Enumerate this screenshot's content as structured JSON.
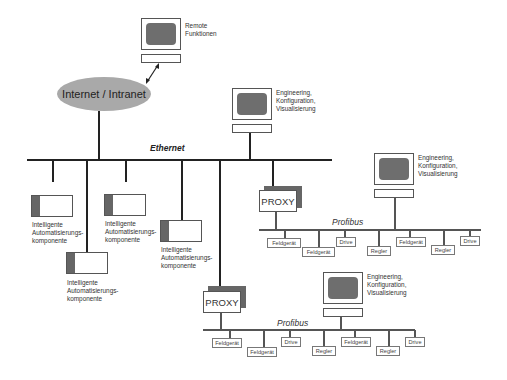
{
  "diagram": {
    "cloud": {
      "label": "Internet / Intranet"
    },
    "remote": {
      "label": "Remote\nFunktionen"
    },
    "engineering_top": {
      "label": "Engineering,\nKonfiguration,\nVisualisierung"
    },
    "ethernet": {
      "label": "Ethernet"
    },
    "components": [
      {
        "label": "Intelligente\nAutomatisierungs-\nkomponente"
      },
      {
        "label": "Intelligente\nAutomatisierungs-\nkomponente"
      },
      {
        "label": "Intelligente\nAutomatisierungs-\nkomponente"
      },
      {
        "label": "Intelligente\nAutomatisierungs-\nkomponente"
      }
    ],
    "profibus_1": {
      "proxy_label": "PROXY",
      "bus_label": "Profibus",
      "engineering_label": "Engineering,\nKonfiguration,\nVisualisierung",
      "devices": [
        "Feldgerät",
        "Feldgerät",
        "Drive",
        "Regler",
        "Feldgerät",
        "Regler",
        "Drive"
      ]
    },
    "profibus_2": {
      "proxy_label": "PROXY",
      "bus_label": "Profibus",
      "engineering_label": "Engineering,\nKonfiguration,\nVisualisierung",
      "devices": [
        "Feldgerät",
        "Feldgerät",
        "Drive",
        "Regler",
        "Feldgerät",
        "Regler",
        "Drive"
      ]
    },
    "colors": {
      "cloud": "#a9a9a9",
      "screen": "#6e6e6e",
      "line": "#222222",
      "accent_bar": "#666666"
    }
  }
}
